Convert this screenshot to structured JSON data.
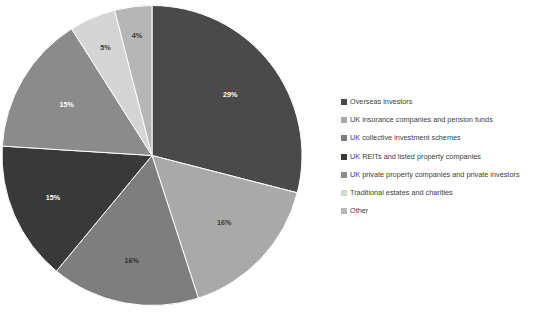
{
  "chart_data": {
    "type": "pie",
    "title": "",
    "subtitle": "",
    "legend_position": "right",
    "grid": false,
    "start_angle_deg": 0,
    "direction": "clockwise",
    "categories": [
      "Overseas investors",
      "UK insurance companies and pension funds",
      "UK collective investment schemes",
      "UK REITs and listed property companies",
      "UK private property companies and private investors",
      "Traditional estates and charities",
      "Other"
    ],
    "values": [
      29,
      16,
      16,
      15,
      15,
      5,
      4
    ],
    "value_unit": "%",
    "data_labels": [
      "29%",
      "16%",
      "16%",
      "15%",
      "15%",
      "5%",
      "4%"
    ],
    "colors": [
      "#4a4a4a",
      "#a9a9a9",
      "#7e7e7e",
      "#393939",
      "#8b8b8b",
      "#d5d5d5",
      "#b6b6b6"
    ],
    "label_colors": [
      "#ffffff",
      "#3a3a3a",
      "#2f2f2f",
      "#ffffff",
      "#ffffff",
      "#3a3a3a",
      "#3a3a3a"
    ]
  },
  "legend": {
    "items": [
      {
        "label": "Overseas investors",
        "color": "#4a4a4a"
      },
      {
        "label": "UK insurance companies and pension funds",
        "color": "#a9a9a9"
      },
      {
        "label": "UK collective investment schemes",
        "color": "#7e7e7e"
      },
      {
        "label": "UK REITs and listed property companies",
        "color": "#393939"
      },
      {
        "label": "UK private property companies and private investors",
        "color": "#8b8b8b"
      },
      {
        "label": "Traditional estates and charities",
        "color": "#d5d5d5"
      },
      {
        "label": "Other",
        "color": "#b6b6b6"
      }
    ]
  }
}
